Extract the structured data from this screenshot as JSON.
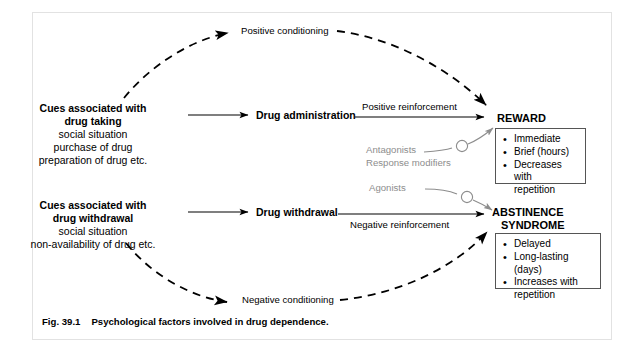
{
  "figure": {
    "caption_number": "Fig. 39.1",
    "caption_text": "Psychological factors involved in drug dependence."
  },
  "nodes": {
    "cue_taking": {
      "heading_line1": "Cues associated with",
      "heading_line2": "drug taking",
      "sub_line1": "social situation",
      "sub_line2": "purchase of drug",
      "sub_line3": "preparation of drug etc."
    },
    "cue_withdrawal": {
      "heading_line1": "Cues associated with",
      "heading_line2": "drug withdrawal",
      "sub_line1": "social situation",
      "sub_line2": "non-availability of drug etc."
    },
    "drug_administration": "Drug administration",
    "drug_withdrawal": "Drug withdrawal",
    "reward": "REWARD",
    "abstinence_line1": "ABSTINENCE",
    "abstinence_line2": "SYNDROME"
  },
  "edge_labels": {
    "positive_conditioning": "Positive conditioning",
    "negative_conditioning": "Negative conditioning",
    "positive_reinforcement": "Positive reinforcement",
    "negative_reinforcement": "Negative reinforcement"
  },
  "modulators": {
    "antagonists": "Antagonists",
    "response_modifiers": "Response modifiers",
    "agonists": "Agonists",
    "sign": "−",
    "color": "#8d8d8d"
  },
  "reward_facts": {
    "items": [
      "Immediate",
      "Brief (hours)",
      "Decreases with",
      "repetition"
    ]
  },
  "abstinence_facts": {
    "items": [
      "Delayed",
      "Long-lasting (days)",
      "Increases with",
      "repetition"
    ]
  },
  "style": {
    "line_color": "#000000",
    "box_border": "#555555",
    "frame_border": "#e2e2e2",
    "background": "#ffffff"
  }
}
